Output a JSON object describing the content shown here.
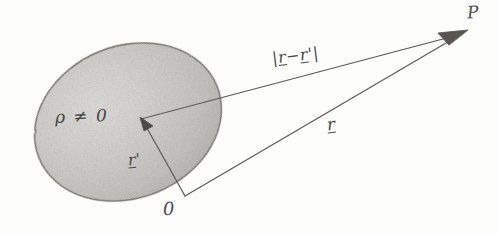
{
  "figure": {
    "background_color": "#fdfdfc",
    "ink_color": "#4a4a4a",
    "width": 498,
    "height": 235
  },
  "region": {
    "name": "charge-distribution-blob",
    "label": "ρ ≠ 0",
    "density_symbol": "ρ",
    "relation": "≠",
    "value": "0",
    "fill_color": "#cfcdc9",
    "edge_color": "#7b7874",
    "center_x": 128,
    "center_y": 122,
    "radius_x": 96,
    "radius_y": 76,
    "rotation_deg": -22
  },
  "points": [
    {
      "name": "origin",
      "label": "0",
      "x": 185,
      "y": 196
    },
    {
      "name": "field-point",
      "label": "P",
      "x": 465,
      "y": 32
    },
    {
      "name": "source-point",
      "label": "",
      "x": 141,
      "y": 119
    }
  ],
  "vectors": [
    {
      "name": "r-prime",
      "label": "r'",
      "label_text": "r",
      "label_prime": "'",
      "description": "source vector from origin into charge distribution",
      "from_x": 185,
      "from_y": 196,
      "to_x": 141,
      "to_y": 119,
      "underlined": true
    },
    {
      "name": "r",
      "label": "r",
      "label_text": "r",
      "description": "field vector from origin to point P",
      "from_x": 185,
      "from_y": 196,
      "to_x": 463,
      "to_y": 33,
      "underlined": true
    },
    {
      "name": "separation",
      "label": "|r - r'|",
      "label_open": "|",
      "label_first": "r",
      "label_minus": "−",
      "label_second": "r",
      "label_prime": "'",
      "label_close": "|",
      "description": "separation vector from source point to field point",
      "from_x": 141,
      "from_y": 119,
      "to_x": 463,
      "to_y": 33,
      "underlined": true
    }
  ],
  "labels": {
    "rho": "ρ ≠ 0",
    "separation": "|r − r′|",
    "r": "r",
    "r_prime": "r′",
    "origin": "0",
    "point_p": "P"
  }
}
